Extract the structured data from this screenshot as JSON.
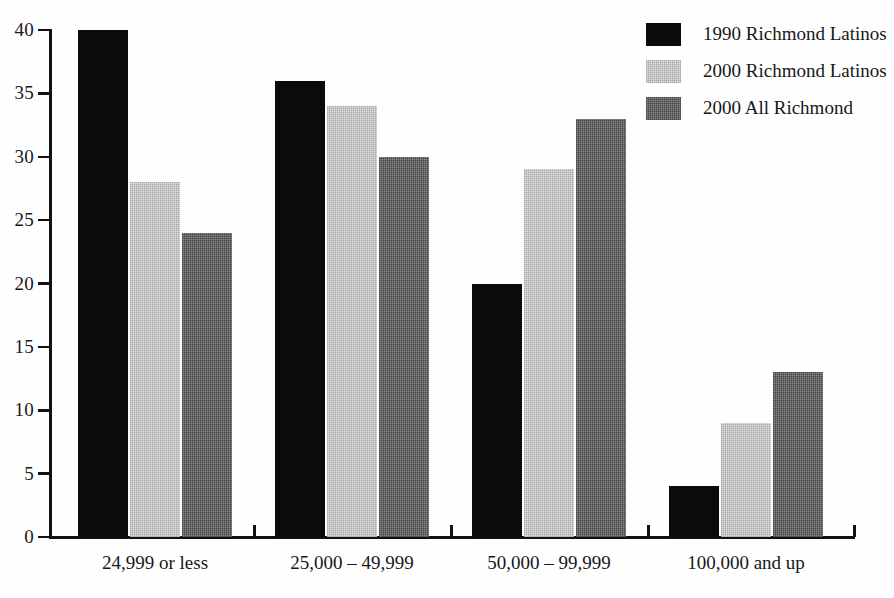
{
  "chart_data": {
    "type": "bar",
    "title": "",
    "subtitle": "",
    "xlabel": "",
    "ylabel": "",
    "ylim": [
      0,
      40
    ],
    "ytick_step": 5,
    "grid": false,
    "legend_position": "top-right",
    "categories": [
      "24,999 or less",
      "25,000 – 49,999",
      "50,000 – 99,999",
      "100,000 and up"
    ],
    "ytick_labels": [
      "0",
      "5",
      "10",
      "15",
      "20",
      "25",
      "30",
      "35",
      "40"
    ],
    "ytick_values": [
      0,
      5,
      10,
      15,
      20,
      25,
      30,
      35,
      40
    ],
    "series": [
      {
        "name": "1990 Richmond Latinos",
        "color": "#0b0b0b",
        "values": [
          40,
          36,
          20,
          4
        ]
      },
      {
        "name": "2000 Richmond Latinos",
        "color": "#e3e3e3",
        "values": [
          28,
          34,
          29,
          9
        ]
      },
      {
        "name": "2000 All Richmond",
        "color": "#8a8a8a",
        "values": [
          24,
          30,
          33,
          13
        ]
      }
    ]
  },
  "legend": {
    "items": [
      {
        "label": "1990 Richmond Latinos",
        "swatch": "black-swatch"
      },
      {
        "label": "2000 Richmond Latinos",
        "swatch": "light-gray-swatch"
      },
      {
        "label": "2000 All Richmond",
        "swatch": "mid-gray-swatch"
      }
    ]
  },
  "axis": {
    "y_labels": [
      "40",
      "35",
      "30",
      "25",
      "20",
      "15",
      "10",
      "5",
      "0"
    ],
    "x_labels": [
      "24,999 or less",
      "25,000 – 49,999",
      "50,000 – 99,999",
      "100,000 and up"
    ]
  },
  "colors": {
    "series_1": "#0b0b0b",
    "series_2": "#e3e3e3",
    "series_3": "#8a8a8a",
    "axis": "#111111",
    "text": "#181818",
    "background": "#fefefe"
  }
}
